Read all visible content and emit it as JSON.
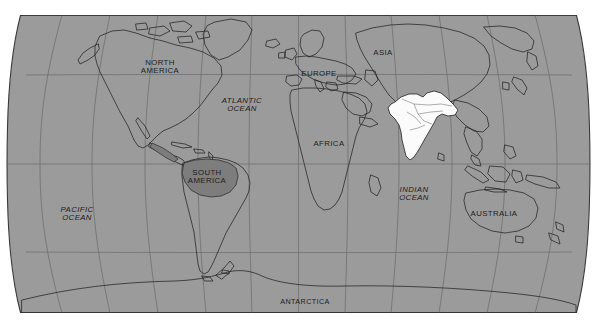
{
  "image": {
    "kind": "world-map",
    "projection": "robinson",
    "title": "World map with India highlighted",
    "background_color": "#ffffff",
    "ocean_color": "#9b9b9b",
    "land_outline_color": "#2b2b2b",
    "graticule_color": "#5a5a5a",
    "frame_color": "#3a3a3a",
    "highlight_color": "#fbfbfb",
    "secondary_shade_color": "#7d7d7d"
  },
  "highlight": {
    "country": "India",
    "fill": "#fbfbfb",
    "stroke": "#2b2b2b"
  },
  "secondary_shade": {
    "region": "South America label backing",
    "fill": "#7d7d7d"
  },
  "graticule": {
    "latitudes": [
      "60N",
      "30N",
      "0",
      "30S",
      "60S"
    ],
    "longitudes": [
      "150W",
      "120W",
      "90W",
      "60W",
      "30W",
      "0",
      "30E",
      "60E",
      "90E",
      "120E",
      "150E"
    ],
    "grid": true
  },
  "labels": {
    "continents": [
      {
        "name": "north-america",
        "text": "NORTH\nAMERICA",
        "x": 160,
        "y": 67,
        "size": "sz8"
      },
      {
        "name": "south-america",
        "text": "SOUTH\nAMERICA",
        "x": 207,
        "y": 177,
        "size": "sz8"
      },
      {
        "name": "europe",
        "text": "EUROPE",
        "x": 319,
        "y": 74,
        "size": "sz8"
      },
      {
        "name": "africa",
        "text": "AFRICA",
        "x": 329,
        "y": 144,
        "size": "sz8"
      },
      {
        "name": "asia",
        "text": "ASIA",
        "x": 383,
        "y": 53,
        "size": "sz8"
      },
      {
        "name": "australia",
        "text": "AUSTRALIA",
        "x": 494,
        "y": 214,
        "size": "sz8"
      },
      {
        "name": "antarctica",
        "text": "ANTARCTICA",
        "x": 305,
        "y": 302,
        "size": "sz75"
      }
    ],
    "oceans": [
      {
        "name": "pacific-ocean",
        "text": "PACIFIC\nOCEAN",
        "x": 77,
        "y": 214,
        "size": "sz8"
      },
      {
        "name": "atlantic-ocean",
        "text": "ATLANTIC\nOCEAN",
        "x": 242,
        "y": 105,
        "size": "sz8"
      },
      {
        "name": "indian-ocean",
        "text": "INDIAN\nOCEAN",
        "x": 414,
        "y": 194,
        "size": "sz8"
      }
    ]
  }
}
